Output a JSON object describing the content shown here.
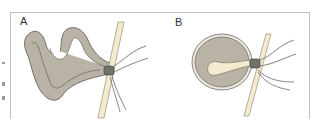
{
  "figure": {
    "panels": [
      {
        "label": "A",
        "description": "Twisted loop of bowel with narrow neck through constricting band"
      },
      {
        "label": "B",
        "description": "Closed loop, rounded, with neck constriction"
      }
    ],
    "colors": {
      "bowel": "#b9b3a6",
      "bowel_outline": "#5a5650",
      "band": "#f3ead0",
      "constriction": "#6e736c",
      "vessel": "#f4f0f2",
      "frame": "#bdbdbd"
    }
  }
}
